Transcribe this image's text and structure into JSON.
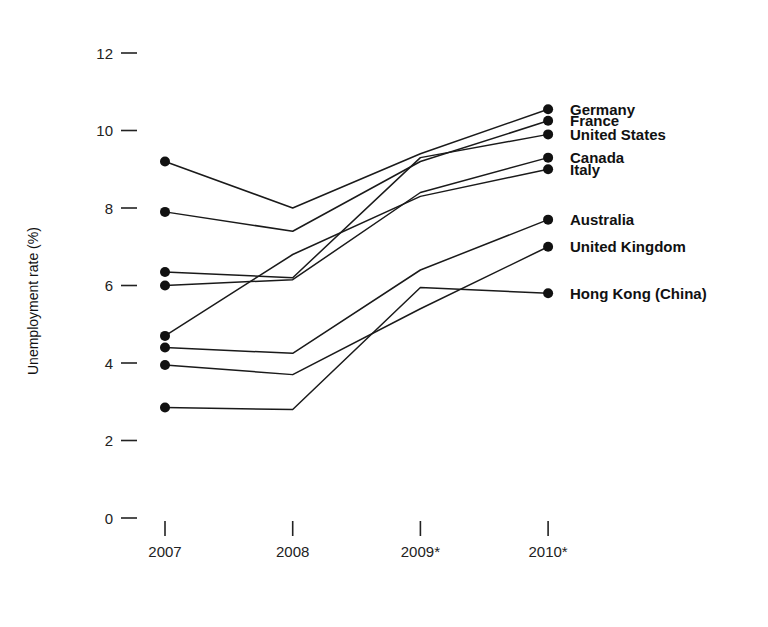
{
  "chart_data": {
    "type": "line",
    "title": "",
    "xlabel": "",
    "ylabel": "Unemployment rate (%)",
    "x": [
      "2007",
      "2008",
      "2009*",
      "2010*"
    ],
    "xtick_labels": [
      "2007",
      "2008",
      "2009*",
      "2010*"
    ],
    "ytick_labels": [
      "12",
      "10",
      "8",
      "6",
      "4",
      "2",
      "0"
    ],
    "ytick_values": [
      12,
      10,
      8,
      6,
      4,
      2,
      0
    ],
    "ylim": [
      0,
      12
    ],
    "grid": false,
    "legend_position": "right-of-plot-at-line-ends",
    "markers": "filled-circle-at-each-point",
    "series": [
      {
        "name": "Germany",
        "values": [
          9.2,
          8.0,
          9.4,
          10.55
        ]
      },
      {
        "name": "France",
        "values": [
          7.9,
          7.4,
          9.2,
          10.25
        ]
      },
      {
        "name": "United States",
        "values": [
          6.35,
          6.2,
          9.3,
          9.9
        ]
      },
      {
        "name": "Canada",
        "values": [
          6.0,
          6.15,
          8.4,
          9.3
        ]
      },
      {
        "name": "Italy",
        "values": [
          4.7,
          6.8,
          8.3,
          9.0
        ]
      },
      {
        "name": "Australia",
        "values": [
          4.4,
          4.25,
          6.4,
          7.7
        ]
      },
      {
        "name": "United Kingdom",
        "values": [
          3.95,
          3.7,
          5.4,
          7.0
        ]
      },
      {
        "name": "Hong Kong (China)",
        "values": [
          2.85,
          2.8,
          5.95,
          5.8
        ]
      }
    ],
    "series_labels": [
      {
        "name": "Germany",
        "label_y": 10.55
      },
      {
        "name": "France",
        "label_y": 10.25
      },
      {
        "name": "United States",
        "label_y": 9.9
      },
      {
        "name": "Canada",
        "label_y": 9.3
      },
      {
        "name": "Italy",
        "label_y": 9.0
      },
      {
        "name": "Australia",
        "label_y": 7.7
      },
      {
        "name": "United Kingdom",
        "label_y": 7.0
      },
      {
        "name": "Hong Kong (China)",
        "label_y": 5.8
      }
    ],
    "colors": {
      "line": "#1a1a1a",
      "marker": "#111111",
      "text": "#111111",
      "background": "#ffffff"
    }
  }
}
